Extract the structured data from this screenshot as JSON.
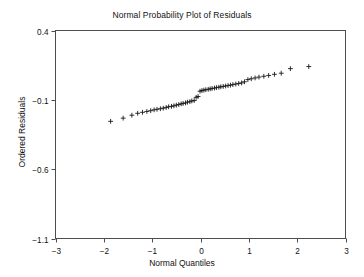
{
  "chart_data": {
    "type": "scatter",
    "title": "Normal Probability Plot of Residuals",
    "xlabel": "Normal Quantiles",
    "ylabel": "Ordered Residuals",
    "xlim": [
      -3,
      3
    ],
    "ylim": [
      -1.1,
      0.4
    ],
    "xticks": [
      -3,
      -2,
      -1,
      0,
      1,
      2,
      3
    ],
    "xticklabels": [
      "−3",
      "−2",
      "−1",
      "0",
      "1",
      "2",
      "3"
    ],
    "yticks": [
      0.4,
      -0.1,
      -0.6,
      -1.1
    ],
    "yticklabels": [
      "0.4",
      "−0.1",
      "−0.6",
      "−1.1"
    ],
    "grid": false,
    "legend": false,
    "marker": "plus",
    "marker_color": "#1a1a1a",
    "series": [
      {
        "name": "Ordered Residuals",
        "x": [
          -1.86,
          -1.6,
          -1.42,
          -1.3,
          -1.2,
          -1.11,
          -1.03,
          -0.96,
          -0.9,
          -0.83,
          -0.77,
          -0.71,
          -0.66,
          -0.6,
          -0.55,
          -0.5,
          -0.45,
          -0.4,
          -0.36,
          -0.31,
          -0.27,
          -0.22,
          -0.18,
          -0.13,
          -0.09,
          -0.05,
          -0.01,
          0.03,
          0.07,
          0.11,
          0.16,
          0.2,
          0.24,
          0.29,
          0.33,
          0.38,
          0.42,
          0.47,
          0.52,
          0.57,
          0.62,
          0.67,
          0.73,
          0.79,
          0.85,
          0.91,
          0.98,
          1.05,
          1.13,
          1.21,
          1.31,
          1.41,
          1.53,
          1.67,
          1.86,
          2.24
        ],
        "y": [
          -0.255,
          -0.232,
          -0.211,
          -0.197,
          -0.19,
          -0.184,
          -0.178,
          -0.172,
          -0.168,
          -0.164,
          -0.16,
          -0.155,
          -0.15,
          -0.147,
          -0.143,
          -0.138,
          -0.134,
          -0.129,
          -0.126,
          -0.122,
          -0.117,
          -0.113,
          -0.108,
          -0.105,
          -0.082,
          -0.076,
          -0.038,
          -0.033,
          -0.03,
          -0.027,
          -0.024,
          -0.021,
          -0.018,
          -0.015,
          -0.012,
          -0.009,
          -0.006,
          -0.003,
          0.0,
          0.003,
          0.006,
          0.01,
          0.014,
          0.018,
          0.022,
          0.03,
          0.046,
          0.052,
          0.058,
          0.064,
          0.07,
          0.076,
          0.084,
          0.092,
          0.125,
          0.14
        ]
      }
    ]
  }
}
